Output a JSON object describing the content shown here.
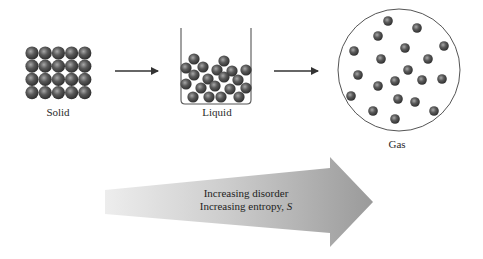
{
  "labels": {
    "solid": "Solid",
    "liquid": "Liquid",
    "gas": "Gas"
  },
  "entropy_arrow": {
    "line1": "Increasing disorder",
    "line2_prefix": "Increasing entropy, ",
    "line2_symbol": "S"
  },
  "colors": {
    "particle_dark": "#3a3a3a",
    "particle_light": "#9a9a9a",
    "outline": "#555555",
    "arrow_start": "#e8e8e8",
    "arrow_end": "#9c9c9c"
  },
  "solid": {
    "rows": 4,
    "cols": 5
  },
  "liquid_particles": [
    [
      194,
      59
    ],
    [
      224,
      61
    ],
    [
      186,
      68
    ],
    [
      203,
      67
    ],
    [
      217,
      70
    ],
    [
      232,
      71
    ],
    [
      246,
      70
    ],
    [
      194,
      75
    ],
    [
      208,
      79
    ],
    [
      224,
      77
    ],
    [
      238,
      80
    ],
    [
      186,
      84
    ],
    [
      201,
      88
    ],
    [
      215,
      86
    ],
    [
      230,
      89
    ],
    [
      246,
      88
    ],
    [
      193,
      97
    ],
    [
      209,
      97
    ],
    [
      221,
      97
    ],
    [
      239,
      97
    ]
  ],
  "gas_particles": [
    [
      388,
      21
    ],
    [
      417,
      28
    ],
    [
      378,
      36
    ],
    [
      354,
      51
    ],
    [
      405,
      48
    ],
    [
      444,
      46
    ],
    [
      381,
      59
    ],
    [
      428,
      59
    ],
    [
      408,
      70
    ],
    [
      358,
      75
    ],
    [
      395,
      81
    ],
    [
      422,
      80
    ],
    [
      442,
      79
    ],
    [
      378,
      86
    ],
    [
      351,
      96
    ],
    [
      398,
      99
    ],
    [
      415,
      102
    ],
    [
      373,
      111
    ],
    [
      434,
      111
    ],
    [
      395,
      119
    ]
  ]
}
